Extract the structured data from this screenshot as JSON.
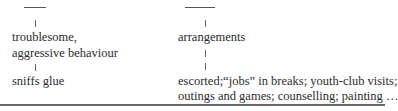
{
  "left_branch": {
    "nodes": [
      "troublesome,",
      "aggressive behaviour",
      "sniffs glue"
    ]
  },
  "right_branch": {
    "nodes": [
      "arrangements",
      "escorted;“jobs” in breaks; youth-club visits;",
      "outings and games; counselling; painting …"
    ]
  }
}
